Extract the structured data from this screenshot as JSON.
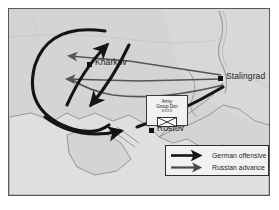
{
  "figure": {
    "kind": "historical-military-map",
    "caption_faint": " "
  },
  "map": {
    "background_color": "#d8d8d8",
    "land_color": "#d2d2d2",
    "water_color": "#e8e8e8",
    "border_color": "#5a5a5a",
    "river_color": "#9a9a9a"
  },
  "cities": [
    {
      "name": "Kharkov",
      "x": 86,
      "y": 58,
      "label_dx": 8,
      "label_dy": -4
    },
    {
      "name": "Stalingrad",
      "x": 217,
      "y": 72,
      "label_dx": 8,
      "label_dy": -4
    },
    {
      "name": "Rostov",
      "x": 148,
      "y": 124,
      "label_dx": 8,
      "label_dy": -4
    }
  ],
  "unit_box": {
    "title_line1": "Army",
    "title_line2": "Group Don",
    "echelon": "XXXX",
    "symbol": "army-group-hq-symbol"
  },
  "legend": {
    "items": [
      {
        "label": "German offensive",
        "color": "#141414",
        "weight": "thick",
        "arrow": "right-arrow-icon"
      },
      {
        "label": "Russian advance",
        "color": "#4a4a4a",
        "weight": "medium",
        "arrow": "right-arrow-icon"
      }
    ]
  },
  "arrows": {
    "german_offensive": [
      {
        "name": "german-arc-northwest-loop",
        "color": "#141414",
        "width": 3.2
      },
      {
        "name": "german-arrow-north-tip",
        "color": "#141414",
        "width": 3.2
      },
      {
        "name": "german-arrow-southwest-tip",
        "color": "#141414",
        "width": 3.2
      },
      {
        "name": "german-arrow-southeast-tip",
        "color": "#141414",
        "width": 3.2
      }
    ],
    "russian_advance": [
      {
        "name": "russian-arrow-stalingrad-to-northwest",
        "color": "#555555",
        "width": 1.8
      },
      {
        "name": "russian-arrow-stalingrad-to-west",
        "color": "#555555",
        "width": 1.8
      },
      {
        "name": "russian-arrow-stalingrad-to-southwest",
        "color": "#555555",
        "width": 1.8
      }
    ]
  },
  "colors": {
    "accent_black": "#141414",
    "accent_gray": "#555555",
    "panel_bg": "#f2f2f2"
  }
}
